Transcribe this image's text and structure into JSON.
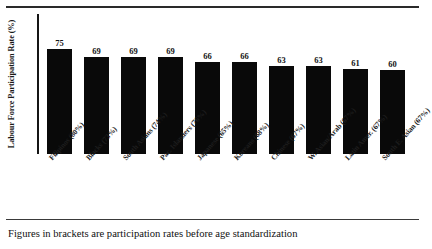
{
  "figure": {
    "caption": "Figures in brackets are participation rates before age standardization",
    "y_axis_title": "Labour Force Participation Rate (%)"
  },
  "chart_data": {
    "type": "bar",
    "title": "",
    "subtitle": "",
    "xlabel": "",
    "ylabel": "Labour Force Participation Rate (%)",
    "ylim": [
      0,
      100
    ],
    "grid": false,
    "legend": "none",
    "orientation": "vertical",
    "bar_color": "#090909",
    "categories": [
      "Filipinos (80%)",
      "Blacks (73%)",
      "South Asians (74%)",
      "Pac. Islanders (76%)",
      "Japanese (65%)",
      "Koreans (68%)",
      "Chinese (67%)",
      "W. Asian/Arab (67%)",
      "Latin Amer. (67%)",
      "South E. Asian (67%)"
    ],
    "group_names": [
      "Filipinos",
      "Blacks",
      "South Asians",
      "Pac. Islanders",
      "Japanese",
      "Koreans",
      "Chinese",
      "W. Asian/Arab",
      "Latin Amer.",
      "South E. Asian"
    ],
    "unstandardized_rates": [
      80,
      73,
      74,
      76,
      65,
      68,
      67,
      67,
      67,
      67
    ],
    "values": [
      75,
      69,
      69,
      69,
      66,
      66,
      63,
      63,
      61,
      60
    ],
    "value_labels": [
      "75",
      "69",
      "69",
      "69",
      "66",
      "66",
      "63",
      "63",
      "61",
      "60"
    ],
    "annotations": [
      "Figures in brackets are participation rates before age standardization"
    ]
  }
}
